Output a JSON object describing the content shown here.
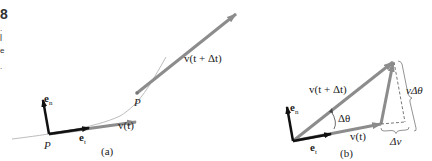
{
  "edge_fragments": {
    "number": "8",
    "marks": [
      ".",
      "l",
      "e",
      "."
    ]
  },
  "diagram_a": {
    "caption": "(a)",
    "point_labels": [
      "P",
      "P"
    ],
    "vectors": {
      "e_n": {
        "base": "e",
        "sub": "n"
      },
      "e_t": {
        "base": "e",
        "sub": "t"
      },
      "v_t": "v(t)",
      "v_t_dt": "v(t + Δt)"
    },
    "colors": {
      "unit_vectors": "#111111",
      "velocity": "#8c8c8c",
      "path": "#b5b5b5"
    }
  },
  "diagram_b": {
    "caption": "(b)",
    "vectors": {
      "e_n": {
        "base": "e",
        "sub": "n"
      },
      "e_t": {
        "base": "e",
        "sub": "t"
      },
      "v_t": "v(t)",
      "v_t_dt": "v(t + Δt)"
    },
    "angle_label": "Δθ",
    "brace_labels": {
      "vertical": "vΔθ",
      "horizontal": "Δv"
    }
  }
}
